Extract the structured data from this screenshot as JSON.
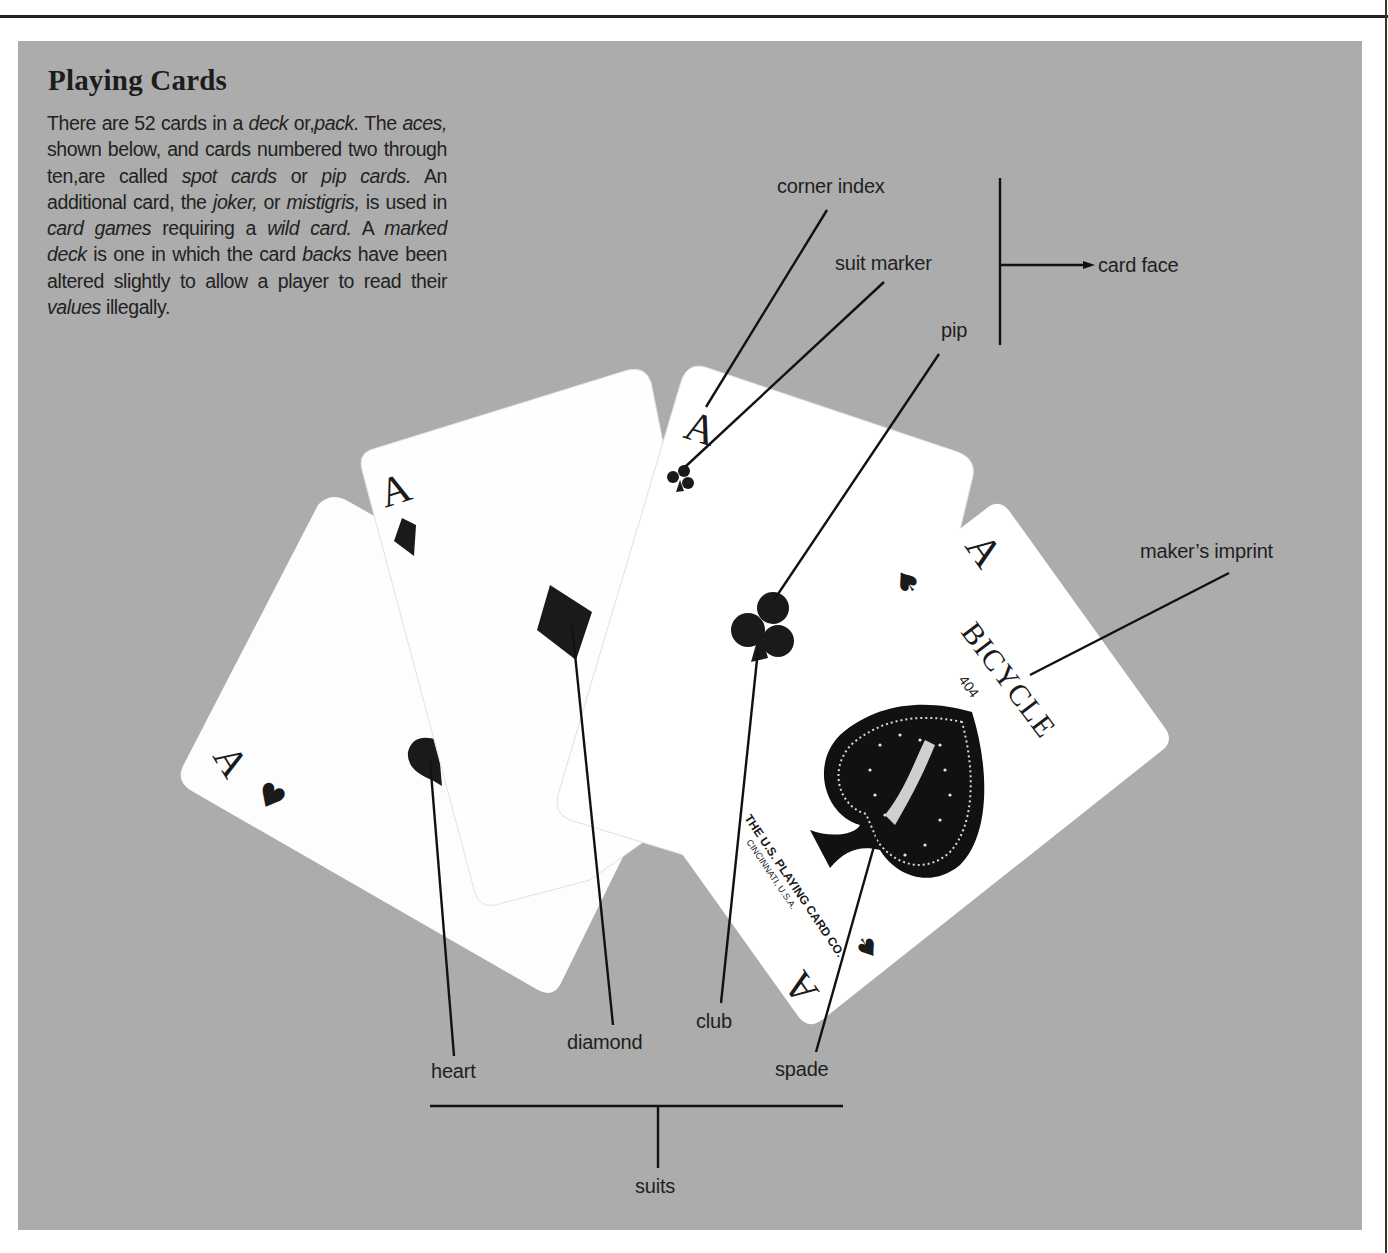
{
  "page": {
    "title": "Playing Cards",
    "intro_segments": [
      {
        "text": "There are 52 cards in a ",
        "italic": false
      },
      {
        "text": "deck",
        "italic": true
      },
      {
        "text": " or,",
        "italic": false
      },
      {
        "text": "pack.",
        "italic": true
      },
      {
        "text": " The ",
        "italic": false
      },
      {
        "text": "aces,",
        "italic": true
      },
      {
        "text": " shown below, and cards numbered two through ten,are called ",
        "italic": false
      },
      {
        "text": "spot cards",
        "italic": true
      },
      {
        "text": " or ",
        "italic": false
      },
      {
        "text": "pip cards.",
        "italic": true
      },
      {
        "text": " An additional card, the ",
        "italic": false
      },
      {
        "text": "joker,",
        "italic": true
      },
      {
        "text": " or ",
        "italic": false
      },
      {
        "text": "mistigris,",
        "italic": true
      },
      {
        "text": " is used in ",
        "italic": false
      },
      {
        "text": "card games",
        "italic": true
      },
      {
        "text": " requiring a ",
        "italic": false
      },
      {
        "text": "wild card.",
        "italic": true
      },
      {
        "text": " A ",
        "italic": false
      },
      {
        "text": "marked deck",
        "italic": true
      },
      {
        "text": " is one in which the card ",
        "italic": false
      },
      {
        "text": "backs",
        "italic": true
      },
      {
        "text": " have been altered slightly to allow a player to read their ",
        "italic": false
      },
      {
        "text": "values",
        "italic": true
      },
      {
        "text": " illegally.",
        "italic": false
      }
    ]
  },
  "labels": {
    "corner_index": "corner index",
    "suit_marker": "suit marker",
    "pip": "pip",
    "card_face": "card face",
    "makers_imprint": "maker’s imprint",
    "heart": "heart",
    "diamond": "diamond",
    "club": "club",
    "spade": "spade",
    "suits": "suits"
  },
  "cards": [
    {
      "name": "ace-of-hearts",
      "rank": "A",
      "suit": "heart",
      "suit_glyph": "♥"
    },
    {
      "name": "ace-of-diamonds",
      "rank": "A",
      "suit": "diamond",
      "suit_glyph": "♦"
    },
    {
      "name": "ace-of-clubs",
      "rank": "A",
      "suit": "club",
      "suit_glyph": "♣"
    },
    {
      "name": "ace-of-spades",
      "rank": "A",
      "suit": "spade",
      "suit_glyph": "♠",
      "brand": "BICYCLE",
      "model": "404",
      "maker_line1": "THE U.S. PLAYING CARD CO.",
      "maker_line2": "CINCINNATI, U.S.A."
    }
  ],
  "colors": {
    "panel": "#acacac",
    "card": "#ffffff",
    "ink": "#1a1a1a"
  }
}
